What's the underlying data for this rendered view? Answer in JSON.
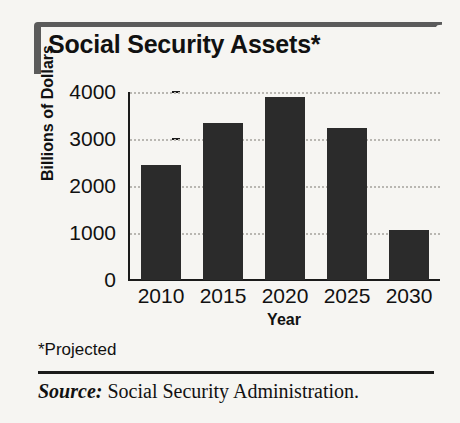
{
  "figure": {
    "title": "Social Security Assets*",
    "footnote": "*Projected",
    "source_label": "Source:",
    "source_text": " Social Security Administration.",
    "accent_color": "#5b5b5b",
    "bar_color": "#2b2b2b",
    "background_color": "#f6f5f2",
    "gridline_color": "#b9b7b2"
  },
  "chart_data": {
    "type": "bar",
    "title": "Social Security Assets*",
    "xlabel": "Year",
    "ylabel": "Billions of Dollars",
    "categories": [
      "2010",
      "2015",
      "2020",
      "2025",
      "2030"
    ],
    "values": [
      2450,
      3350,
      3900,
      3230,
      1070
    ],
    "ylim": [
      0,
      4000
    ],
    "yticks": [
      0,
      1000,
      2000,
      3000,
      4000
    ],
    "ytick_labels": [
      "0",
      "1000",
      "2000",
      "3000",
      "4000"
    ],
    "grid": true,
    "legend": "none",
    "annotations": [
      "*Projected"
    ]
  }
}
